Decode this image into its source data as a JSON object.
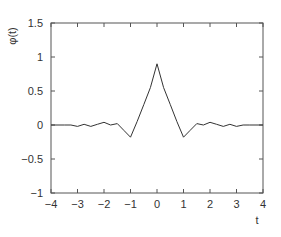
{
  "chart_data": {
    "type": "line",
    "title": "",
    "xlabel": "t",
    "ylabel": "φ(t)",
    "xlim": [
      -4,
      4
    ],
    "ylim": [
      -1,
      1.5
    ],
    "xticks": [
      -4,
      -3,
      -2,
      -1,
      0,
      1,
      2,
      3,
      4
    ],
    "xtick_labels": [
      "−4",
      "−3",
      "−2",
      "−1",
      "0",
      "1",
      "2",
      "3",
      "4"
    ],
    "yticks": [
      -1,
      -0.5,
      0,
      0.5,
      1,
      1.5
    ],
    "ytick_labels": [
      "−1",
      "−0.5",
      "0",
      "0.5",
      "1",
      "1.5"
    ],
    "grid": false,
    "legend": null,
    "series": [
      {
        "name": "φ(t)",
        "color": "#333333",
        "x": [
          -4,
          -3.5,
          -3.25,
          -3,
          -2.75,
          -2.5,
          -2.25,
          -2,
          -1.75,
          -1.5,
          -1.25,
          -1,
          -0.75,
          -0.5,
          -0.25,
          0,
          0.25,
          0.5,
          0.75,
          1,
          1.25,
          1.5,
          1.75,
          2,
          2.25,
          2.5,
          2.75,
          3,
          3.25,
          3.5,
          4
        ],
        "y": [
          0,
          0,
          0,
          -0.02,
          0.01,
          -0.02,
          0.01,
          0.04,
          0.0,
          0.02,
          -0.08,
          -0.18,
          0.05,
          0.3,
          0.55,
          0.9,
          0.55,
          0.3,
          0.05,
          -0.18,
          -0.08,
          0.02,
          0.0,
          0.04,
          0.01,
          -0.02,
          0.01,
          -0.02,
          0,
          0,
          0
        ]
      }
    ]
  }
}
